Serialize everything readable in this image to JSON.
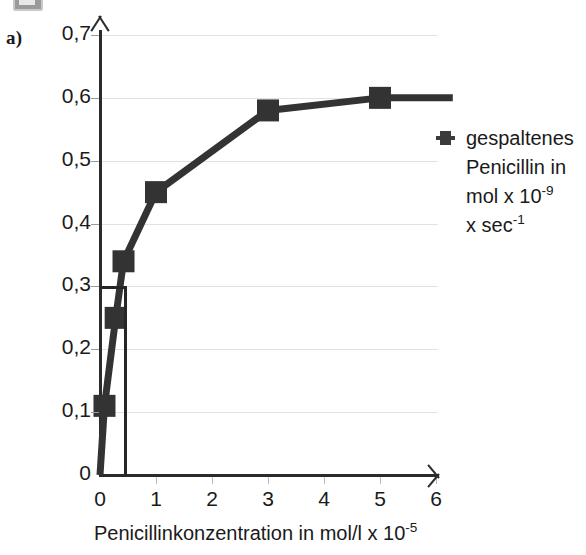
{
  "panel": {
    "label": "a)"
  },
  "chart_data": {
    "type": "line",
    "title": "",
    "subtitle": "",
    "xlabel_parts": {
      "main": "Penicillinkonzentration in mol/l x 10",
      "exponent": "-5"
    },
    "ylabel": "",
    "grid": true,
    "legend_position": "right",
    "xlim": [
      0,
      6.4
    ],
    "ylim": [
      0,
      0.7
    ],
    "x_ticks": [
      "0",
      "1",
      "2",
      "3",
      "4",
      "5",
      "6"
    ],
    "x_tick_values": [
      0,
      1,
      2,
      3,
      4,
      5,
      6
    ],
    "y_ticks": [
      "0",
      "0,1",
      "0,2",
      "0,3",
      "0,4",
      "0,5",
      "0,6",
      "0,7"
    ],
    "y_tick_values": [
      0,
      0.1,
      0.2,
      0.3,
      0.4,
      0.5,
      0.6,
      0.7
    ],
    "series": [
      {
        "name": "gespaltenes Penicillin",
        "marker": "square",
        "color": "#333333",
        "x": [
          0,
          0.08,
          0.28,
          0.42,
          1,
          3,
          5,
          6.3
        ],
        "y": [
          0,
          0.11,
          0.25,
          0.34,
          0.45,
          0.58,
          0.6,
          0.6
        ],
        "marker_x": [
          0.08,
          0.28,
          0.42,
          1,
          3,
          5
        ],
        "marker_y": [
          0.11,
          0.25,
          0.34,
          0.45,
          0.58,
          0.6
        ]
      }
    ],
    "annotations": [
      {
        "type": "construction-lines",
        "y_value": 0.3,
        "x_value": 0.43,
        "description": "horizontal line at 0,3 to curve, then vertical drop to x-axis"
      }
    ],
    "legend": {
      "entries": [
        {
          "marker": "square",
          "lines": [
            {
              "text": "gespaltenes",
              "exponent": ""
            },
            {
              "text": "Penicillin in",
              "exponent": ""
            },
            {
              "text": "mol x 10",
              "exponent": "-9"
            },
            {
              "text": "x sec",
              "exponent": "-1"
            }
          ]
        }
      ]
    }
  }
}
